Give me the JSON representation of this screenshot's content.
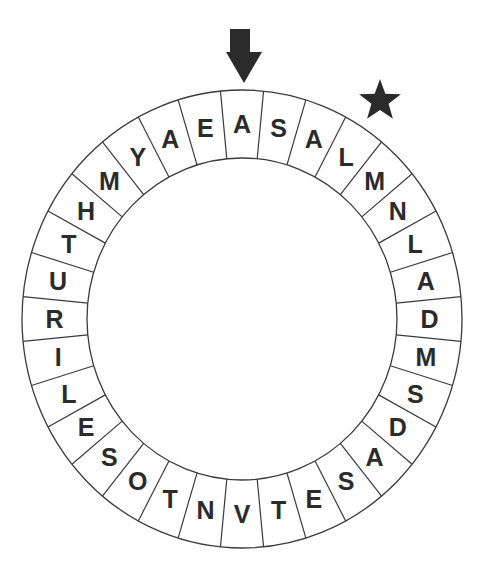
{
  "puzzle": {
    "type": "letter-wheel",
    "segment_count": 32,
    "start_marker": "arrow-down-icon",
    "direction_marker": "star-icon",
    "letters_clockwise_from_arrow": [
      "A",
      "S",
      "A",
      "L",
      "M",
      "N",
      "L",
      "A",
      "D",
      "M",
      "S",
      "D",
      "A",
      "S",
      "E",
      "T",
      "V",
      "N",
      "T",
      "O",
      "S",
      "E",
      "L",
      "I",
      "R",
      "U",
      "T",
      "H",
      "M",
      "Y",
      "A",
      "E"
    ]
  },
  "colors": {
    "ink": "#2b2b2b",
    "line": "#3a3a3a",
    "background": "#ffffff"
  }
}
